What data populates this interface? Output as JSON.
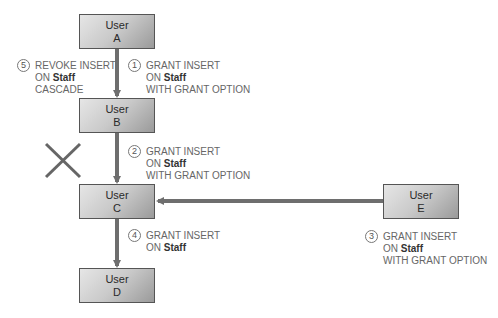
{
  "nodes": {
    "a": {
      "line1": "User",
      "line2": "A"
    },
    "b": {
      "line1": "User",
      "line2": "B"
    },
    "c": {
      "line1": "User",
      "line2": "C"
    },
    "d": {
      "line1": "User",
      "line2": "D"
    },
    "e": {
      "line1": "User",
      "line2": "E"
    }
  },
  "steps": {
    "s1": {
      "num": "1",
      "l1": "GRANT INSERT",
      "on": "ON ",
      "obj": "Staff",
      "l3": "WITH GRANT OPTION"
    },
    "s2": {
      "num": "2",
      "l1": "GRANT INSERT",
      "on": "ON ",
      "obj": "Staff",
      "l3": "WITH GRANT OPTION"
    },
    "s3": {
      "num": "3",
      "l1": "GRANT INSERT",
      "on": "ON ",
      "obj": "Staff",
      "l3": "WITH GRANT OPTION"
    },
    "s4": {
      "num": "4",
      "l1": "GRANT INSERT",
      "on": "ON ",
      "obj": "Staff"
    },
    "s5": {
      "num": "5",
      "l1": "REVOKE INSERT",
      "on": "ON ",
      "obj": "Staff",
      "l3": "CASCADE"
    }
  },
  "colors": {
    "arrow": "#6e6e6e",
    "box_border": "#555555"
  }
}
